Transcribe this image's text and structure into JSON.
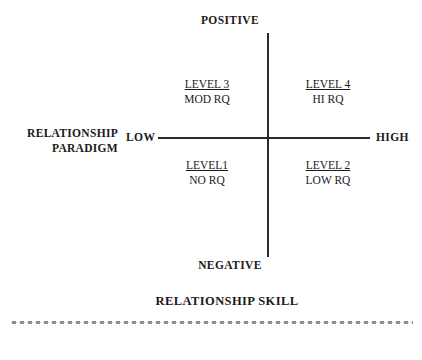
{
  "figure": {
    "axes": {
      "vertical": {
        "top_label": "POSITIVE",
        "bottom_label": "NEGATIVE"
      },
      "horizontal": {
        "left_label": "LOW",
        "right_label": "HIGH"
      }
    },
    "y_axis_title": {
      "line1": "RELATIONSHIP",
      "line2": "PARADIGM"
    },
    "x_axis_title": "RELATIONSHIP SKILL",
    "quadrants": [
      {
        "id": "level-3",
        "position": "top-left",
        "level": "LEVEL 3",
        "rq": "MOD RQ"
      },
      {
        "id": "level-4",
        "position": "top-right",
        "level": "LEVEL 4",
        "rq": "HI RQ"
      },
      {
        "id": "level-1",
        "position": "bottom-left",
        "level": "LEVEL1",
        "rq": "NO RQ"
      },
      {
        "id": "level-2",
        "position": "bottom-right",
        "level": "LEVEL 2",
        "rq": "LOW RQ"
      }
    ],
    "colors": {
      "axis_line": "#2b2b2b",
      "text": "#1a1a1a",
      "dotted_rule": "#8d8d8d",
      "background": "#ffffff"
    }
  }
}
